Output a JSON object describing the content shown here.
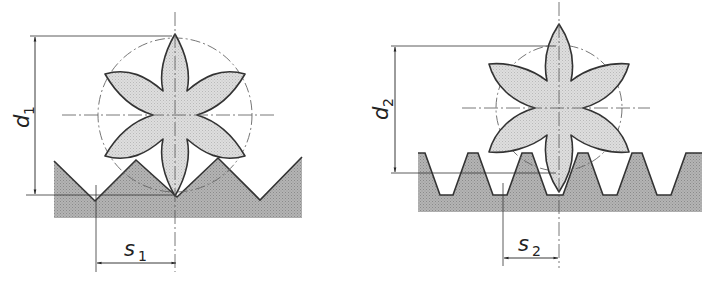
{
  "figure": {
    "type": "technical-drawing",
    "colors": {
      "background": "#ffffff",
      "rack_fill": "#a9a9a9",
      "gear_fill": "#d6d6d6",
      "outline": "#3a3a3a",
      "dimension_line": "#333333",
      "centerline": "#555555"
    },
    "left": {
      "diameter_label": {
        "symbol": "d",
        "subscript": "1"
      },
      "spacing_label": {
        "symbol": "s",
        "subscript": "1"
      },
      "rack_type": "V-teeth",
      "gear_lobes": 6
    },
    "right": {
      "diameter_label": {
        "symbol": "d",
        "subscript": "2"
      },
      "spacing_label": {
        "symbol": "s",
        "subscript": "2"
      },
      "rack_type": "trapezoidal-teeth",
      "gear_lobes": 6
    }
  }
}
